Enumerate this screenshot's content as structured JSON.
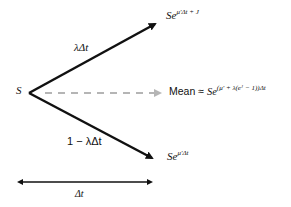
{
  "diagram": {
    "origin_label": "S",
    "up_branch": {
      "probability": "λΔt",
      "outcome_base": "Se",
      "outcome_exponent": "μ′Δt + J"
    },
    "down_branch": {
      "probability": "1 − λΔt",
      "outcome_base": "Se",
      "outcome_exponent": "μ′Δt"
    },
    "mean_branch": {
      "prefix": "Mean ≈ ",
      "outcome_base": "Se",
      "outcome_exponent": "(μ′ + λ(eᴶ − 1))Δt"
    },
    "time_span_label": "Δt",
    "colors": {
      "arrow": "#111111",
      "dashed_arrow": "#b5b5b5",
      "text": "#111111"
    }
  }
}
